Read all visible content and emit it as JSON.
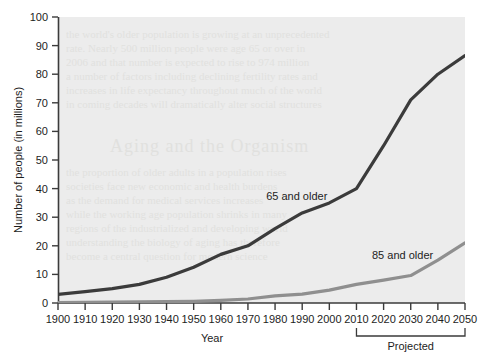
{
  "chart_data": {
    "type": "line",
    "title": "",
    "xlabel": "Year",
    "ylabel": "Number of people (in millions)",
    "xlim": [
      1900,
      2050
    ],
    "ylim": [
      0,
      100
    ],
    "grid": false,
    "legend_position": "inline-annotation",
    "x": [
      1900,
      1910,
      1920,
      1930,
      1940,
      1950,
      1960,
      1970,
      1980,
      1990,
      2000,
      2010,
      2020,
      2030,
      2040,
      2050
    ],
    "xticklabels": [
      "1900",
      "1910",
      "1920",
      "1930",
      "1940",
      "1950",
      "1960",
      "1970",
      "1980",
      "1990",
      "2000",
      "2010",
      "2020",
      "2030",
      "2040",
      "2050"
    ],
    "yticks": [
      0,
      10,
      20,
      30,
      40,
      50,
      60,
      70,
      80,
      90,
      100
    ],
    "yticklabels": [
      "0",
      "10",
      "20",
      "30",
      "40",
      "50",
      "60",
      "70",
      "80",
      "90",
      "100"
    ],
    "series": [
      {
        "name": "65 and older",
        "color": "#3b3b3b",
        "values": [
          3,
          4,
          5,
          6.5,
          9,
          12.5,
          17,
          20,
          26,
          31.5,
          35,
          40,
          55,
          71,
          80,
          86.5
        ]
      },
      {
        "name": "85 and older",
        "color": "#8f8f8f",
        "values": [
          0.1,
          0.2,
          0.3,
          0.4,
          0.5,
          0.6,
          0.9,
          1.4,
          2.5,
          3.1,
          4.5,
          6.5,
          8.0,
          9.6,
          15.0,
          21.0
        ]
      }
    ],
    "annotations": [
      {
        "text": "65 and older",
        "x": 1988,
        "y": 36,
        "name": "series-label-65-and-older"
      },
      {
        "text": "85 and older",
        "x": 2027,
        "y": 15.5,
        "name": "series-label-85-and-older"
      }
    ],
    "brackets": [
      {
        "label": "Projected",
        "from": 2010,
        "to": 2050,
        "name": "projected-bracket"
      }
    ],
    "plot_background": "#ececec"
  },
  "axes": {
    "x_title": "Year",
    "y_title": "Number of people (in millions)"
  },
  "colors": {
    "series_65": "#3b3b3b",
    "series_85": "#8f8f8f",
    "plot_bg": "#ececec",
    "axis": "#3b3b3b",
    "page_bg": "#ffffff"
  }
}
